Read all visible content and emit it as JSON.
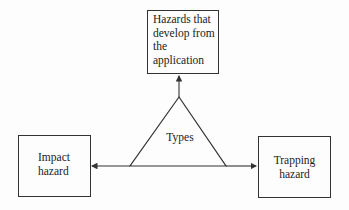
{
  "diagram": {
    "center": {
      "label": "Types",
      "shape": "triangle"
    },
    "nodes": [
      {
        "id": "top",
        "label_lines": [
          "Hazards that",
          "develop from",
          "the",
          "application"
        ]
      },
      {
        "id": "left",
        "label_lines": [
          "Impact",
          "hazard"
        ]
      },
      {
        "id": "right",
        "label_lines": [
          "Trapping",
          "hazard"
        ]
      }
    ],
    "edges": [
      {
        "from": "center",
        "to": "top"
      },
      {
        "from": "center",
        "to": "left"
      },
      {
        "from": "center",
        "to": "right"
      }
    ],
    "colors": {
      "line": "#333333",
      "text": "#222222",
      "background": "#fdfdfd"
    }
  }
}
